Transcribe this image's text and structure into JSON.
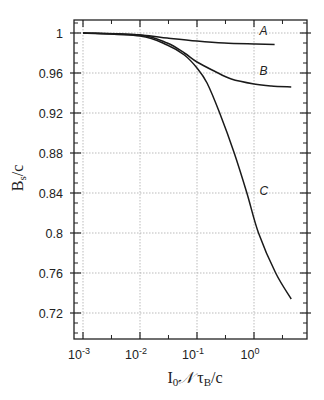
{
  "chart_data": {
    "type": "line",
    "title": "",
    "xlabel": "I0 N τB/c",
    "ylabel": "Bs/c",
    "xscale": "log",
    "xlim": [
      0.0006,
      6.5
    ],
    "ylim": [
      0.694,
      1.013
    ],
    "grid": true,
    "legend": "inline labels",
    "x_ticks": [
      {
        "value": 0.001,
        "base": "10",
        "exp": "-3"
      },
      {
        "value": 0.01,
        "base": "10",
        "exp": "-2"
      },
      {
        "value": 0.1,
        "base": "10",
        "exp": "-1"
      },
      {
        "value": 1,
        "base": "10",
        "exp": "0"
      }
    ],
    "y_ticks": [
      1,
      0.96,
      0.92,
      0.88,
      0.84,
      0.8,
      0.76,
      0.72
    ],
    "y_tick_labels": [
      "1",
      "0.96",
      "0.92",
      "0.88",
      "0.84",
      "0.8",
      "0.76",
      "0.72"
    ],
    "series": [
      {
        "name": "A",
        "label_pos": {
          "x": 1.25,
          "y": 0.998
        },
        "x": [
          0.001,
          0.01,
          0.03,
          0.1,
          0.3,
          1,
          2.3
        ],
        "y": [
          1.0,
          0.998,
          0.995,
          0.992,
          0.99,
          0.989,
          0.9885
        ]
      },
      {
        "name": "B",
        "label_pos": {
          "x": 1.25,
          "y": 0.958
        },
        "x": [
          0.001,
          0.01,
          0.03,
          0.06,
          0.1,
          0.2,
          0.4,
          1,
          2,
          4.5
        ],
        "y": [
          1.0,
          0.998,
          0.99,
          0.98,
          0.971,
          0.962,
          0.954,
          0.949,
          0.947,
          0.946
        ]
      },
      {
        "name": "C",
        "label_pos": {
          "x": 1.25,
          "y": 0.838
        },
        "x": [
          0.001,
          0.01,
          0.03,
          0.06,
          0.1,
          0.15,
          0.25,
          0.45,
          0.75,
          1.2,
          2.4,
          4.5
        ],
        "y": [
          1.0,
          0.997,
          0.988,
          0.978,
          0.965,
          0.95,
          0.92,
          0.88,
          0.84,
          0.8,
          0.76,
          0.734
        ]
      }
    ]
  },
  "labels": {
    "ylabel_main": "B",
    "ylabel_sub": "s",
    "ylabel_rest": "/c",
    "xlabel_I": "I",
    "xlabel_0": "0",
    "xlabel_N": "𝒩",
    "xlabel_tau": " τ",
    "xlabel_B": "B",
    "xlabel_rest": "/c"
  }
}
